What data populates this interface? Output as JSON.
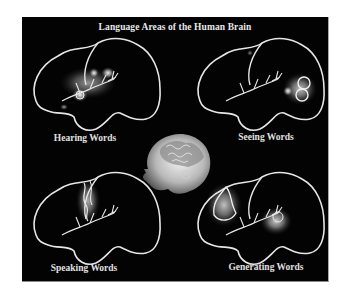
{
  "figure": {
    "title": "Language Areas of the Human Brain",
    "background_color": "#030303",
    "panels": [
      {
        "id": "hearing",
        "label": "Hearing Words",
        "activation_region": "temporal"
      },
      {
        "id": "seeing",
        "label": "Seeing Words",
        "activation_region": "occipital"
      },
      {
        "id": "speaking",
        "label": "Speaking Words",
        "activation_region": "motor"
      },
      {
        "id": "generating",
        "label": "Generating Words",
        "activation_region": "frontal-temporal"
      }
    ],
    "center_image": "3d-head-brain-render"
  }
}
